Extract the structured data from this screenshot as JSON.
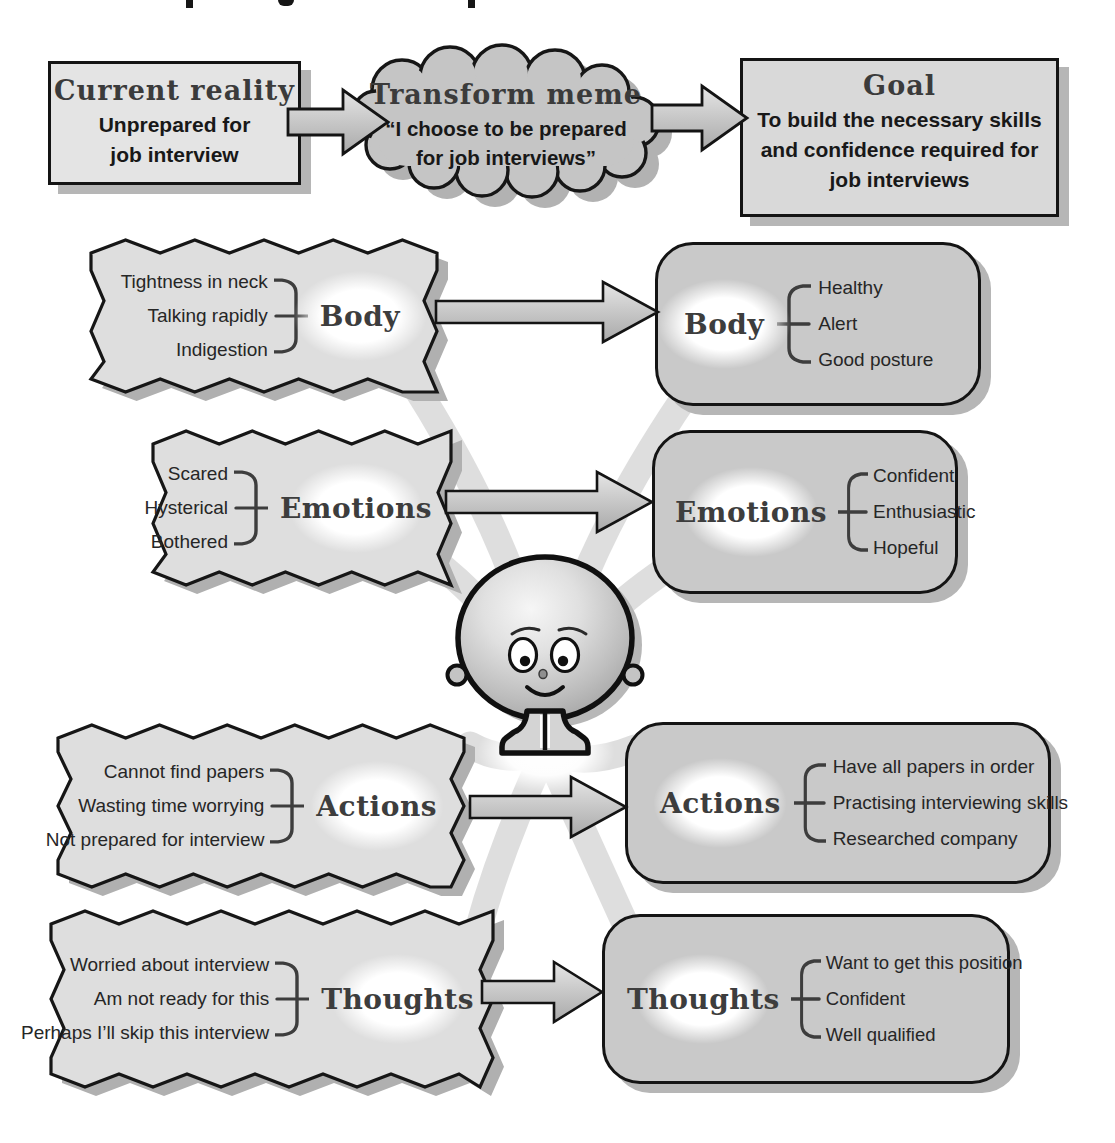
{
  "flow": {
    "current_reality": {
      "title": "Current reality",
      "text": "Unprepared for job interview"
    },
    "transform_meme": {
      "title": "Transform meme",
      "text": "“I choose to be prepared for job interviews”"
    },
    "goal": {
      "title": "Goal",
      "text": "To build the necessary skills and confidence required for job interviews"
    }
  },
  "rows": [
    {
      "id": "body",
      "label": "Body",
      "before": [
        "Tightness in neck",
        "Talking rapidly",
        "Indigestion"
      ],
      "after": [
        "Healthy",
        "Alert",
        "Good posture"
      ]
    },
    {
      "id": "emotions",
      "label": "Emotions",
      "before": [
        "Scared",
        "Hysterical",
        "Bothered"
      ],
      "after": [
        "Confident",
        "Enthusiastic",
        "Hopeful"
      ]
    },
    {
      "id": "actions",
      "label": "Actions",
      "before": [
        "Cannot find papers",
        "Wasting time worrying",
        "Not prepared for interview"
      ],
      "after": [
        "Have all papers in order",
        "Practising interviewing skills",
        "Researched company"
      ]
    },
    {
      "id": "thoughts",
      "label": "Thoughts",
      "before": [
        "Worried about interview",
        "Am not ready for this",
        "Perhaps I’ll skip this interview"
      ],
      "after": [
        "Want to get this position",
        "Confident",
        "Well qualified"
      ]
    }
  ],
  "icons": {
    "mascot": "smiling-round-head-figure"
  },
  "colors": {
    "background": "#ffffff",
    "outline": "#141414",
    "before_box_fill": "#dedede",
    "after_box_fill": "#c9c9c9",
    "cloud_fill": "#c5c5c5",
    "reality_box_fill": "#e4e4e4",
    "goal_box_fill": "#d9d9d9",
    "arrow_fill_light": "#e3e3e3",
    "arrow_fill_dark": "#a9a9a9",
    "shadow": "#b6b6b6",
    "label_color": "#3d3d3d",
    "beam": "#c9c9c9"
  }
}
